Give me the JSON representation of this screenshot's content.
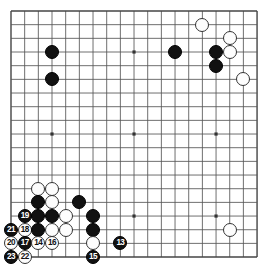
{
  "board": {
    "type": "go-board",
    "size": 19,
    "visible_columns": 18,
    "visible_rows": 19,
    "line_color": "#555555",
    "border_color": "#444444",
    "background_color": "#ffffff",
    "black_color": "#111111",
    "white_color": "#fdfdfd",
    "origin_x": 11,
    "origin_y": 11,
    "spacing": 13.67,
    "stone_radius": 7.0,
    "star_points": [
      {
        "col": 3,
        "row": 3
      },
      {
        "col": 9,
        "row": 3
      },
      {
        "col": 15,
        "row": 3
      },
      {
        "col": 3,
        "row": 9
      },
      {
        "col": 9,
        "row": 9
      },
      {
        "col": 15,
        "row": 9
      },
      {
        "col": 3,
        "row": 15
      },
      {
        "col": 9,
        "row": 15
      },
      {
        "col": 15,
        "row": 15
      }
    ],
    "stones": [
      {
        "col": 3,
        "row": 3,
        "color": "black",
        "label": ""
      },
      {
        "col": 3,
        "row": 5,
        "color": "black",
        "label": ""
      },
      {
        "col": 14,
        "row": 1,
        "color": "white",
        "label": ""
      },
      {
        "col": 12,
        "row": 3,
        "color": "black",
        "label": ""
      },
      {
        "col": 16,
        "row": 2,
        "color": "white",
        "label": ""
      },
      {
        "col": 15,
        "row": 3,
        "color": "black",
        "label": ""
      },
      {
        "col": 16,
        "row": 3,
        "color": "white",
        "label": ""
      },
      {
        "col": 15,
        "row": 4,
        "color": "black",
        "label": ""
      },
      {
        "col": 17,
        "row": 5,
        "color": "white",
        "label": ""
      },
      {
        "col": 2,
        "row": 13,
        "color": "white",
        "label": ""
      },
      {
        "col": 3,
        "row": 13,
        "color": "white",
        "label": ""
      },
      {
        "col": 2,
        "row": 14,
        "color": "black",
        "label": ""
      },
      {
        "col": 3,
        "row": 14,
        "color": "white",
        "label": ""
      },
      {
        "col": 5,
        "row": 14,
        "color": "black",
        "label": ""
      },
      {
        "col": 1,
        "row": 15,
        "color": "black",
        "label": "19"
      },
      {
        "col": 2,
        "row": 15,
        "color": "black",
        "label": ""
      },
      {
        "col": 3,
        "row": 15,
        "color": "black",
        "label": ""
      },
      {
        "col": 4,
        "row": 15,
        "color": "white",
        "label": ""
      },
      {
        "col": 6,
        "row": 15,
        "color": "black",
        "label": ""
      },
      {
        "col": 0,
        "row": 16,
        "color": "black",
        "label": "21"
      },
      {
        "col": 1,
        "row": 16,
        "color": "white",
        "label": "18"
      },
      {
        "col": 2,
        "row": 16,
        "color": "black",
        "label": ""
      },
      {
        "col": 3,
        "row": 16,
        "color": "white",
        "label": ""
      },
      {
        "col": 4,
        "row": 16,
        "color": "white",
        "label": ""
      },
      {
        "col": 6,
        "row": 16,
        "color": "black",
        "label": ""
      },
      {
        "col": 0,
        "row": 17,
        "color": "white",
        "label": "20"
      },
      {
        "col": 1,
        "row": 17,
        "color": "black",
        "label": "17"
      },
      {
        "col": 2,
        "row": 17,
        "color": "white",
        "label": "14"
      },
      {
        "col": 3,
        "row": 17,
        "color": "white",
        "label": "16"
      },
      {
        "col": 6,
        "row": 17,
        "color": "white",
        "label": ""
      },
      {
        "col": 8,
        "row": 17,
        "color": "black",
        "label": "13"
      },
      {
        "col": 0,
        "row": 18,
        "color": "black",
        "label": "23"
      },
      {
        "col": 1,
        "row": 18,
        "color": "white",
        "label": "22"
      },
      {
        "col": 6,
        "row": 18,
        "color": "black",
        "label": "15"
      },
      {
        "col": 16,
        "row": 16,
        "color": "white",
        "label": ""
      }
    ]
  },
  "move_sequence": {
    "label": "Numbered moves",
    "moves": [
      "13",
      "14",
      "15",
      "16",
      "17",
      "18",
      "19",
      "20",
      "21",
      "22",
      "23"
    ]
  }
}
